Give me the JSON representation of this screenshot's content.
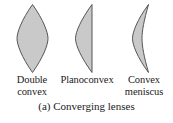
{
  "figure": {
    "caption": "(a) Converging lenses",
    "lens_fill_color": "#c9c9c9",
    "lens_stroke_color": "#555555",
    "background_color": "#ffffff",
    "text_color": "#1a1a1a"
  },
  "lenses": [
    {
      "name": "double-convex",
      "label_line1": "Double",
      "label_line2": "convex",
      "shape": "biconvex"
    },
    {
      "name": "planoconvex",
      "label_line1": "Planoconvex",
      "label_line2": "",
      "shape": "plano-convex"
    },
    {
      "name": "convex-meniscus",
      "label_line1": "Convex",
      "label_line2": "meniscus",
      "shape": "meniscus"
    }
  ]
}
